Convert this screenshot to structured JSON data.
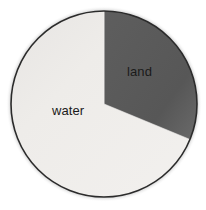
{
  "figure": {
    "background_color": "#ffffff",
    "width": 206,
    "height": 210
  },
  "chart_data": {
    "type": "pie",
    "title": "",
    "subtitle": "",
    "xlabel": "",
    "ylabel": "",
    "grid": false,
    "legend_position": "none",
    "labels_inside_slices": true,
    "start_angle_deg": 0,
    "direction": "clockwise",
    "categories": [
      "land",
      "water"
    ],
    "values": [
      31.25,
      68.75
    ],
    "units": "percent",
    "slices": [
      {
        "label": "land",
        "value": 31.25,
        "fraction": 0.3125,
        "start_angle_deg": 0,
        "end_angle_deg": 112.5,
        "color": "#595959",
        "label_color": "#1a1a1a"
      },
      {
        "label": "water",
        "value": 68.75,
        "fraction": 0.6875,
        "start_angle_deg": 112.5,
        "end_angle_deg": 360,
        "color": "#edebe9",
        "label_color": "#1a1a1a"
      }
    ],
    "annotations": []
  },
  "style": {
    "outline_color": "#2b2b2b",
    "outline_width_px": 1.6,
    "center_x": 104,
    "center_y": 104,
    "radius": 93
  }
}
